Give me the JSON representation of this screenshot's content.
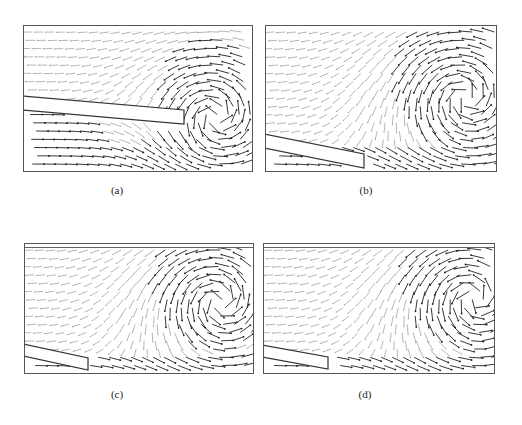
{
  "figure": {
    "panels": [
      {
        "id": "a",
        "caption": "(a)",
        "box": [
          23,
          25,
          230,
          147
        ],
        "top_wall": false,
        "plate": {
          "x1": 0,
          "y1": 70,
          "x2": 160,
          "y2": 84,
          "thickness": 14
        },
        "vortex": {
          "cx": 192,
          "cy": 90,
          "r": 60,
          "strength": 1.0
        },
        "below_flow": "right",
        "above_flow": "left",
        "caption_pos": [
          114,
          184
        ]
      },
      {
        "id": "b",
        "caption": "(b)",
        "box": [
          265,
          25,
          232,
          147
        ],
        "top_wall": false,
        "plate": {
          "x1": 0,
          "y1": 108,
          "x2": 98,
          "y2": 128,
          "thickness": 14
        },
        "vortex": {
          "cx": 200,
          "cy": 72,
          "r": 75,
          "strength": 1.0
        },
        "below_flow": "right",
        "above_flow": "left",
        "caption_pos": [
          364,
          184
        ]
      },
      {
        "id": "c",
        "caption": "(c)",
        "box": [
          24,
          243,
          230,
          131
        ],
        "top_wall": true,
        "plate": {
          "x1": 0,
          "y1": 100,
          "x2": 63,
          "y2": 114,
          "thickness": 12
        },
        "vortex": {
          "cx": 195,
          "cy": 58,
          "r": 70,
          "strength": 1.0
        },
        "below_flow": "right",
        "above_flow": "left",
        "caption_pos": [
          114,
          388
        ]
      },
      {
        "id": "d",
        "caption": "(d)",
        "box": [
          263,
          243,
          232,
          131
        ],
        "top_wall": true,
        "plate": {
          "x1": 0,
          "y1": 101,
          "x2": 64,
          "y2": 113,
          "thickness": 12
        },
        "vortex": {
          "cx": 210,
          "cy": 55,
          "r": 75,
          "strength": 1.0
        },
        "below_flow": "right",
        "above_flow": "left",
        "caption_pos": [
          363,
          388
        ]
      }
    ],
    "colors": {
      "arrow_dark": "#222222",
      "arrow_light": "#999999",
      "plate_edge": "#333333",
      "border": "#555555"
    }
  }
}
